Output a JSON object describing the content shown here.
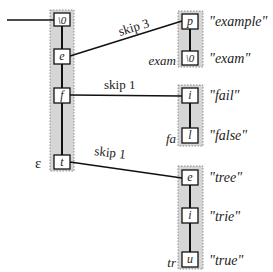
{
  "diagram": {
    "root": {
      "shade_label": "ε",
      "nodes": [
        {
          "char": "\\0"
        },
        {
          "char": "e"
        },
        {
          "char": "f"
        },
        {
          "char": "t"
        }
      ]
    },
    "edges": [
      {
        "from": "e",
        "label": "skip 3"
      },
      {
        "from": "f",
        "label": "skip 1"
      },
      {
        "from": "t",
        "label": "skip 1"
      }
    ],
    "groups": [
      {
        "prefix": "exam",
        "nodes": [
          {
            "char": "p",
            "word": "\"example\""
          },
          {
            "char": "\\0",
            "word": "\"exam\""
          }
        ]
      },
      {
        "prefix": "fa",
        "nodes": [
          {
            "char": "i",
            "word": "\"fail\""
          },
          {
            "char": "l",
            "word": "\"false\""
          }
        ]
      },
      {
        "prefix": "tr",
        "nodes": [
          {
            "char": "e",
            "word": "\"tree\""
          },
          {
            "char": "i",
            "word": "\"trie\""
          },
          {
            "char": "u",
            "word": "\"true\""
          }
        ]
      }
    ]
  }
}
